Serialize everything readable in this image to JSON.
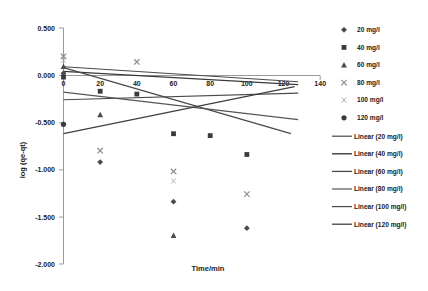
{
  "chart_data": {
    "type": "scatter",
    "title": "",
    "xlabel": "Time/min",
    "ylabel": "log (qe-qt)",
    "xlim": [
      0,
      140
    ],
    "ylim": [
      -2.0,
      0.5
    ],
    "xticks": [
      0,
      20,
      40,
      60,
      80,
      100,
      120,
      140
    ],
    "yticks": [
      0.5,
      0.0,
      -0.5,
      -1.0,
      -1.5,
      -2.0
    ],
    "xtick_labels": [
      "0",
      "20",
      "40",
      "60",
      "80",
      "100",
      "120",
      "140"
    ],
    "ytick_labels": [
      "0.500",
      "0.000",
      "-0.500",
      "-1.000",
      "-1.500",
      "-2.000"
    ],
    "grid": false,
    "legend_position": "right",
    "series": [
      {
        "name": "20 mg/l",
        "marker": "diamond",
        "color": "#4a4a4a",
        "x": [
          0,
          20,
          60,
          100
        ],
        "y": [
          0.02,
          -0.92,
          -1.34,
          -1.62
        ]
      },
      {
        "name": "40 mg/l",
        "marker": "square",
        "color": "#3a3a3a",
        "x": [
          0,
          20,
          40,
          60,
          80,
          100
        ],
        "y": [
          -0.02,
          -0.17,
          -0.2,
          -0.62,
          -0.64,
          -0.84
        ]
      },
      {
        "name": "60 mg/l",
        "marker": "triangle",
        "color": "#4a4a4a",
        "x": [
          0,
          20,
          60
        ],
        "y": [
          0.09,
          -0.42,
          -1.7
        ]
      },
      {
        "name": "80 mg/l",
        "marker": "x",
        "color": "#8c8c8c",
        "x": [
          0,
          20,
          40,
          60,
          100
        ],
        "y": [
          0.2,
          -0.8,
          0.14,
          -1.02,
          -1.26
        ]
      },
      {
        "name": "100 mg/l",
        "marker": "x-thin",
        "color": "#a8a8a8",
        "x": [
          0,
          60
        ],
        "y": [
          0.16,
          -1.12
        ]
      },
      {
        "name": "120 mg/l",
        "marker": "circle",
        "color": "#3a3a3a",
        "x": [
          0
        ],
        "y": [
          -0.52
        ]
      }
    ],
    "trendlines": [
      {
        "name": "Linear (20 mg/l)",
        "color": "#4a4a4a",
        "width": 1.1,
        "x0": 0,
        "y0": 0.09,
        "x1": 128,
        "y1": -0.07
      },
      {
        "name": "Linear (40 mg/l)",
        "color": "#3a3a3a",
        "width": 1.4,
        "x0": 0,
        "y0": 0.04,
        "x1": 128,
        "y1": -0.1
      },
      {
        "name": "Linear (60 mg/l)",
        "color": "#4a4a4a",
        "width": 1.3,
        "x0": 0,
        "y0": 0.08,
        "x1": 124,
        "y1": -0.62
      },
      {
        "name": "Linear (80 mg/l)",
        "color": "#555555",
        "width": 1.2,
        "x0": 0,
        "y0": -0.18,
        "x1": 128,
        "y1": -0.47
      },
      {
        "name": "Linear (100 mg/l)",
        "color": "#4a4a4a",
        "width": 1.1,
        "x0": 0,
        "y0": -0.26,
        "x1": 128,
        "y1": -0.19
      },
      {
        "name": "Linear (120 mg/l)",
        "color": "#3f3f3f",
        "width": 1.3,
        "x0": 0,
        "y0": -0.62,
        "x1": 126,
        "y1": -0.12
      }
    ]
  },
  "legend": {
    "markers": [
      {
        "label": "20 mg/l",
        "glyph": "diamond-marker"
      },
      {
        "label": "40 mg/l",
        "glyph": "square-marker"
      },
      {
        "label": "60 mg/l",
        "glyph": "triangle-marker"
      },
      {
        "label": "80 mg/l",
        "glyph": "x-marker"
      },
      {
        "label": "100 mg/l",
        "glyph": "x-thin-marker"
      },
      {
        "label": "120 mg/l",
        "glyph": "circle-marker"
      }
    ],
    "lines": [
      {
        "label": "Linear (20 mg/l)"
      },
      {
        "label": "Linear (40 mg/l)"
      },
      {
        "label": "Linear (60 mg/l)"
      },
      {
        "label": "Linear (80 mg/l)"
      },
      {
        "label": "Linear (100 mg/l)"
      },
      {
        "label": "Linear (120 mg/l)"
      }
    ]
  }
}
